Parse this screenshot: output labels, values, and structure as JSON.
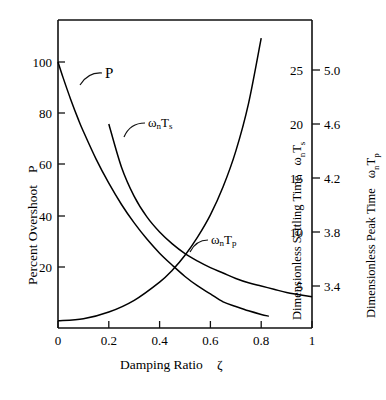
{
  "chart_data": {
    "type": "line",
    "title": "",
    "xlabel": "Damping Ratio   ζ",
    "xlim": [
      0,
      1
    ],
    "xticks": [
      0,
      0.2,
      0.4,
      0.6,
      0.8,
      1
    ],
    "xticklabels": [
      "0",
      "0.2",
      "0.4",
      "0.6",
      "0.8",
      "1"
    ],
    "grid": false,
    "legend": "inline curve labels",
    "axes": [
      {
        "id": "left",
        "label": "Percent Overshoot   P",
        "position": "left",
        "lim": [
          0,
          110
        ],
        "ticks": [
          20,
          40,
          60,
          80,
          100
        ],
        "ticklabels": [
          "20",
          "40",
          "60",
          "80",
          "100"
        ]
      },
      {
        "id": "right-inner",
        "label": "Dimensionless Settling Time   ωₙTₛ",
        "position": "right",
        "lim": [
          0,
          28
        ],
        "ticks": [
          5,
          10,
          15,
          20,
          25
        ],
        "ticklabels": [
          "5",
          "10",
          "15",
          "20",
          "25"
        ]
      },
      {
        "id": "right-outer",
        "label": "Dimensionless Peak Time   ωₙTₚ",
        "position": "right",
        "lim": [
          3.0,
          5.2
        ],
        "ticks": [
          3.4,
          3.8,
          4.2,
          4.6,
          5.0
        ],
        "ticklabels": [
          "3.4",
          "3.8",
          "4.2",
          "4.6",
          "5.0"
        ]
      }
    ],
    "series": [
      {
        "name": "P",
        "label": "P",
        "axis": "left",
        "color": "#000000",
        "x": [
          0.0,
          0.02,
          0.05,
          0.08,
          0.1,
          0.15,
          0.2,
          0.25,
          0.3,
          0.35,
          0.4,
          0.45,
          0.5,
          0.55,
          0.6,
          0.65,
          0.7,
          0.75,
          0.8,
          0.83
        ],
        "y": [
          100.0,
          93.9,
          85.4,
          77.6,
          72.9,
          62.1,
          52.7,
          44.4,
          37.2,
          30.9,
          25.4,
          20.7,
          16.3,
          12.6,
          9.5,
          6.4,
          4.6,
          2.9,
          1.5,
          0.8
        ]
      },
      {
        "name": "wnTs",
        "label": "ωₙTₛ",
        "axis": "right-inner",
        "color": "#000000",
        "x": [
          0.2,
          0.25,
          0.3,
          0.35,
          0.4,
          0.45,
          0.5,
          0.55,
          0.6,
          0.65,
          0.7,
          0.75,
          0.8,
          0.85,
          0.9,
          0.95,
          1.0
        ],
        "y": [
          20.0,
          16.0,
          13.3,
          11.4,
          10.0,
          8.9,
          8.0,
          7.3,
          6.7,
          6.2,
          5.7,
          5.3,
          5.0,
          4.7,
          4.4,
          4.2,
          4.0
        ]
      },
      {
        "name": "wnTp",
        "label": "ωₙTₚ",
        "axis": "right-outer",
        "color": "#000000",
        "x": [
          0.0,
          0.1,
          0.2,
          0.3,
          0.4,
          0.45,
          0.5,
          0.55,
          0.6,
          0.65,
          0.7,
          0.75,
          0.8,
          0.85,
          0.9,
          0.93
        ],
        "y": [
          3.142,
          3.157,
          3.207,
          3.294,
          3.429,
          3.517,
          3.628,
          3.764,
          3.927,
          4.135,
          4.399,
          4.751,
          5.236,
          5.965,
          7.207,
          8.55
        ]
      }
    ],
    "annotations": [
      {
        "text": "P",
        "for": "P"
      },
      {
        "text": "ωₙTₛ",
        "for": "wnTs"
      },
      {
        "text": "ωₙTₚ",
        "for": "wnTp"
      }
    ]
  },
  "labels": {
    "x_axis_title": "Damping Ratio",
    "x_axis_symbol": "ζ",
    "y_left_title": "Percent Overshoot",
    "y_left_symbol": "P",
    "y_right_inner_title": "Dimensionless Settling Time",
    "y_right_inner_symbol_base": "ω",
    "y_right_inner_symbol_sub": "n",
    "y_right_inner_symbol_tail": "T",
    "y_right_inner_symbol_tail_sub": "s",
    "y_right_outer_title": "Dimensionless Peak Time",
    "y_right_outer_symbol_base": "ω",
    "y_right_outer_symbol_sub": "n",
    "y_right_outer_symbol_tail": "T",
    "y_right_outer_symbol_tail_sub": "p"
  },
  "ticks": {
    "left": [
      "100",
      "80",
      "60",
      "40",
      "20"
    ],
    "bottom": [
      "0",
      "0.2",
      "0.4",
      "0.6",
      "0.8",
      "1"
    ],
    "right_inner": [
      "25",
      "20",
      "15",
      "10",
      "5"
    ],
    "right_outer": [
      "5.0",
      "4.6",
      "4.2",
      "3.8",
      "3.4"
    ]
  },
  "curve_labels": {
    "p": "P",
    "ts_base": "ω",
    "ts_sub": "n",
    "ts_t": "T",
    "ts_tsub": "s",
    "tp_base": "ω",
    "tp_sub": "n",
    "tp_t": "T",
    "tp_tsub": "p"
  },
  "style": {
    "ink": "#111111",
    "paper": "#ffffff"
  }
}
